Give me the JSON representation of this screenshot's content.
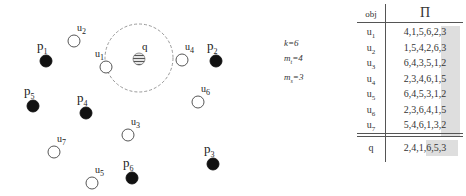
{
  "diagram": {
    "query": {
      "label": "q",
      "x": 139,
      "y": 58,
      "radius_circle": 34
    },
    "points_filled": [
      {
        "label": "p",
        "sub": "1",
        "x": 46,
        "y": 61
      },
      {
        "label": "p",
        "sub": "2",
        "x": 216,
        "y": 61
      },
      {
        "label": "p",
        "sub": "3",
        "x": 213,
        "y": 164
      },
      {
        "label": "p",
        "sub": "4",
        "x": 86,
        "y": 113
      },
      {
        "label": "p",
        "sub": "5",
        "x": 33,
        "y": 106
      },
      {
        "label": "p",
        "sub": "6",
        "x": 132,
        "y": 178
      }
    ],
    "points_open": [
      {
        "label": "u",
        "sub": "1",
        "x": 106,
        "y": 67
      },
      {
        "label": "u",
        "sub": "2",
        "x": 74,
        "y": 41
      },
      {
        "label": "u",
        "sub": "3",
        "x": 128,
        "y": 135
      },
      {
        "label": "u",
        "sub": "4",
        "x": 182,
        "y": 60
      },
      {
        "label": "u",
        "sub": "5",
        "x": 92,
        "y": 183
      },
      {
        "label": "u",
        "sub": "6",
        "x": 198,
        "y": 102
      },
      {
        "label": "u",
        "sub": "7",
        "x": 54,
        "y": 152
      }
    ]
  },
  "params": {
    "k": "k=6",
    "mt_base": "m",
    "mt_sub": "t",
    "mt_val": "=4",
    "ms_base": "m",
    "ms_sub": "s",
    "ms_val": "=3"
  },
  "table": {
    "header_obj": "obj",
    "header_perm": "Π",
    "rows": [
      {
        "obj": "u",
        "sub": "1",
        "perm": "4,1,5,6,2,3"
      },
      {
        "obj": "u",
        "sub": "2",
        "perm": "1,5,4,2,6,3"
      },
      {
        "obj": "u",
        "sub": "3",
        "perm": "6,4,3,5,1,2"
      },
      {
        "obj": "u",
        "sub": "4",
        "perm": "2,3,4,6,1,5"
      },
      {
        "obj": "u",
        "sub": "5",
        "perm": "6,4,5,3,1,2"
      },
      {
        "obj": "u",
        "sub": "6",
        "perm": "2,3,6,4,1,5"
      },
      {
        "obj": "u",
        "sub": "7",
        "perm": "5,4,6,1,3,2"
      }
    ],
    "query_row": {
      "obj": "q",
      "perm": "2,4,1,6,5,3"
    },
    "shade_color": "#dedede"
  }
}
